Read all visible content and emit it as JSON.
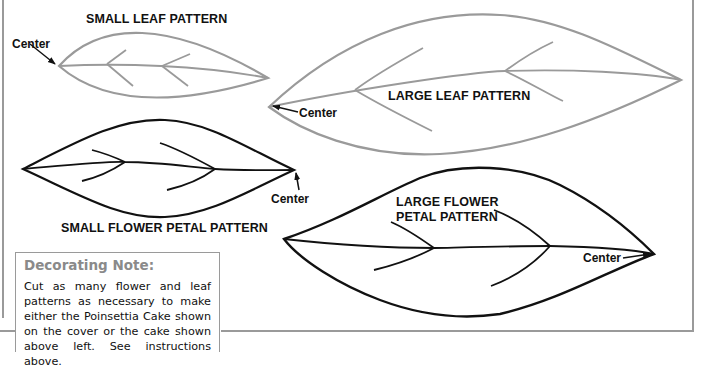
{
  "patterns": {
    "small_leaf": {
      "title": "SMALL LEAF PATTERN",
      "center_label": "Center",
      "stroke": "#9a9a9a"
    },
    "large_leaf": {
      "title": "LARGE LEAF PATTERN",
      "center_label": "Center",
      "stroke": "#9a9a9a"
    },
    "small_flower_petal": {
      "title": "SMALL FLOWER PETAL PATTERN",
      "center_label": "Center",
      "stroke": "#111111"
    },
    "large_flower_petal": {
      "title_line1": "LARGE FLOWER",
      "title_line2": "PETAL PATTERN",
      "center_label": "Center",
      "stroke": "#111111"
    }
  },
  "note": {
    "title": "Decorating Note:",
    "body": "Cut as many flower and leaf patterns as necessary to make either the Poinsettia Cake shown on the cover or the cake shown above left. See instructions above."
  },
  "colors": {
    "frame": "#9a9a9a",
    "leaf_stroke": "#9a9a9a",
    "petal_stroke": "#111111",
    "note_title": "#8a8a8a"
  }
}
